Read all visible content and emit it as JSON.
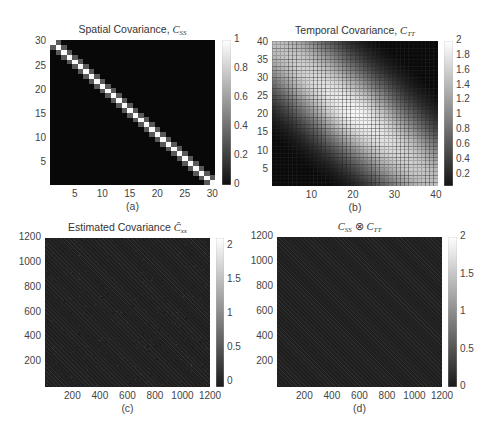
{
  "figure": {
    "panels": [
      {
        "id": "a",
        "caption": "(a)",
        "title_text": "Spatial Covariance, ",
        "title_symbol": "C",
        "title_sub": "SS",
        "plot": {
          "x": 50,
          "y": 40,
          "w": 165,
          "h": 145
        },
        "colorbar": {
          "x": 222,
          "y": 40,
          "w": 9,
          "h": 145
        },
        "xticks": [
          "5",
          "10",
          "15",
          "20",
          "25",
          "30"
        ],
        "yticks": [
          "5",
          "10",
          "15",
          "20",
          "25",
          "30"
        ],
        "cbticks": [
          "0",
          "0.2",
          "0.4",
          "0.6",
          "0.8",
          "1"
        ]
      },
      {
        "id": "b",
        "caption": "(b)",
        "title_text": "Temporal Covariance, ",
        "title_symbol": "C",
        "title_sub": "TT",
        "plot": {
          "x": 272,
          "y": 41,
          "w": 166,
          "h": 145
        },
        "colorbar": {
          "x": 444,
          "y": 41,
          "w": 9,
          "h": 145
        },
        "xticks": [
          "10",
          "20",
          "30",
          "40"
        ],
        "yticks": [
          "5",
          "10",
          "15",
          "20",
          "25",
          "30",
          "35",
          "40"
        ],
        "cbticks": [
          "0.2",
          "0.4",
          "0.6",
          "0.8",
          "1",
          "1.2",
          "1.4",
          "1.6",
          "1.8",
          "2"
        ]
      },
      {
        "id": "c",
        "caption": "(c)",
        "title_text": "Estimated Covariance ",
        "title_symbol": "Ĉ",
        "title_sub": "xx",
        "plot": {
          "x": 45,
          "y": 238,
          "w": 165,
          "h": 149
        },
        "colorbar": {
          "x": 216,
          "y": 238,
          "w": 8,
          "h": 149
        },
        "xticks": [
          "200",
          "400",
          "600",
          "800",
          "1000",
          "1200"
        ],
        "yticks": [
          "200",
          "400",
          "600",
          "800",
          "1000",
          "1200"
        ],
        "cbticks": [
          "0",
          "0.5",
          "1",
          "1.5",
          "2"
        ]
      },
      {
        "id": "d",
        "caption": "(d)",
        "title_text": "",
        "title_symbol": "C",
        "title_sub": "SS",
        "title_op": " ⊗ ",
        "title_symbol2": "C",
        "title_sub2": "TT",
        "plot": {
          "x": 277,
          "y": 237,
          "w": 165,
          "h": 150
        },
        "colorbar": {
          "x": 448,
          "y": 237,
          "w": 9,
          "h": 150
        },
        "xticks": [
          "200",
          "400",
          "600",
          "800",
          "1000",
          "1200"
        ],
        "yticks": [
          "200",
          "400",
          "600",
          "800",
          "1000",
          "1200"
        ],
        "cbticks": [
          "0",
          "0.5",
          "1",
          "1.5",
          "2"
        ]
      }
    ]
  },
  "chart_data": [
    {
      "type": "heatmap",
      "panel": "(a)",
      "title": "Spatial Covariance, C_SS",
      "matrix_size": [
        30,
        30
      ],
      "x_range": [
        1,
        30
      ],
      "y_range": [
        1,
        30
      ],
      "xticks": [
        5,
        10,
        15,
        20,
        25,
        30
      ],
      "yticks": [
        5,
        10,
        15,
        20,
        25,
        30
      ],
      "colorbar": {
        "range": [
          0,
          1
        ],
        "ticks": [
          0,
          0.2,
          0.4,
          0.6,
          0.8,
          1
        ],
        "colormap": "gray"
      },
      "description": "Banded matrix: diagonal = 1 (white), first off-diagonals ≈ 0.35 (gray), elsewhere 0 (black). Y-axis increases upward so diagonal runs top-left to bottom-right.",
      "diagonal_value": 1.0,
      "off_diagonal_value": 0.35,
      "background_value": 0.0
    },
    {
      "type": "heatmap",
      "panel": "(b)",
      "title": "Temporal Covariance, C_TT",
      "matrix_size": [
        40,
        40
      ],
      "x_range": [
        1,
        40
      ],
      "y_range": [
        1,
        40
      ],
      "xticks": [
        10,
        20,
        30,
        40
      ],
      "yticks": [
        5,
        10,
        15,
        20,
        25,
        30,
        35,
        40
      ],
      "colorbar": {
        "range": [
          0.05,
          2
        ],
        "ticks": [
          0.2,
          0.4,
          0.6,
          0.8,
          1,
          1.2,
          1.4,
          1.6,
          1.8,
          2
        ],
        "colormap": "gray"
      },
      "description": "Smooth covariance with maximum ≈ 2 along the anti-diagonal band (top-left to bottom-right in display, i.e. x + y ≈ 41), decaying to ≈ 0.1 at bottom-left (1,1) and top-right (40,40) corners. Cell grid lines drawn.",
      "peak_value": 2.0,
      "corner_value": 0.1,
      "grid": true
    },
    {
      "type": "heatmap",
      "panel": "(c)",
      "title": "Estimated Covariance Ĉ_xx",
      "matrix_size": [
        1200,
        1200
      ],
      "x_range": [
        1,
        1200
      ],
      "y_range": [
        1,
        1200
      ],
      "xticks": [
        200,
        400,
        600,
        800,
        1000,
        1200
      ],
      "yticks": [
        200,
        400,
        600,
        800,
        1000,
        1200
      ],
      "colorbar": {
        "range": [
          -0.1,
          2.1
        ],
        "ticks": [
          0,
          0.5,
          1,
          1.5,
          2
        ],
        "colormap": "gray"
      },
      "description": "Mostly near-zero (dark) with faint diagonal striations running top-left to bottom-right; noisy estimate."
    },
    {
      "type": "heatmap",
      "panel": "(d)",
      "title": "C_SS ⊗ C_TT",
      "matrix_size": [
        1200,
        1200
      ],
      "x_range": [
        1,
        1200
      ],
      "y_range": [
        1,
        1200
      ],
      "xticks": [
        200,
        400,
        600,
        800,
        1000,
        1200
      ],
      "yticks": [
        200,
        400,
        600,
        800,
        1000,
        1200
      ],
      "colorbar": {
        "range": [
          0,
          2
        ],
        "ticks": [
          0,
          0.5,
          1,
          1.5,
          2
        ],
        "colormap": "gray"
      },
      "description": "Kronecker product of C_SS and C_TT: mostly dark with faint periodic diagonal striations top-left to bottom-right."
    }
  ]
}
